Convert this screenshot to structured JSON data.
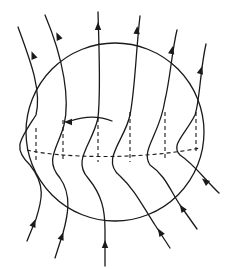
{
  "diagram": {
    "stroke_color": "#1a1a1a",
    "background": "#ffffff",
    "sphere": {
      "cx": 115,
      "cy": 132,
      "r": 89
    },
    "lines": [
      {
        "id": 1,
        "path": "M 27 241 L 36 219 C 42 200, 46 185, 30 165 C 12 148, 20 140, 36 115 C 42 90, 30 60, 18 27",
        "arrow_in": [
          34,
          223,
          -68
        ],
        "arrow_out": [
          33,
          55,
          -112
        ]
      },
      {
        "id": 2,
        "path": "M 55 258 L 63 233 C 68 215, 72 195, 60 178 C 44 160, 58 148, 64 125 C 70 100, 64 60, 45 15",
        "arrow_in": [
          62,
          236,
          -70
        ],
        "arrow_out": [
          58,
          36,
          -115
        ]
      },
      {
        "id": 3,
        "path": "M 105 266 L 105 230 C 105 210, 102 195, 88 178 C 72 160, 92 145, 98 118 C 101 90, 99 50, 98 12",
        "arrow_in": [
          105,
          244,
          -90
        ],
        "arrow_out": [
          98,
          26,
          -90
        ]
      },
      {
        "id": 4,
        "path": "M 170 248 L 155 225 C 142 205, 135 190, 120 176 C 100 160, 125 140, 130 115 C 135 90, 136 50, 140 16",
        "arrow_in": [
          160,
          232,
          -122
        ],
        "arrow_out": [
          137,
          30,
          -85
        ]
      },
      {
        "id": 5,
        "path": "M 197 229 L 180 205 C 170 190, 165 175, 150 165 C 140 150, 160 135, 165 100 C 170 80, 172 50, 177 30",
        "arrow_in": [
          182,
          208,
          -124
        ],
        "arrow_out": [
          172,
          50,
          -78
        ]
      },
      {
        "id": 6,
        "path": "M 219 193 C 205 180, 195 165, 180 155 C 170 145, 185 135, 195 115 C 200 100, 200 70, 206 44",
        "arrow_in": [
          205,
          181,
          -140
        ],
        "arrow_out": [
          201,
          70,
          -75
        ]
      }
    ],
    "equator_dashed": "M 27 150 C 60 158, 140 160, 200 148",
    "vertical_dashed": [
      {
        "x1": 36,
        "y1": 128,
        "x2": 36,
        "y2": 160
      },
      {
        "x1": 63,
        "y1": 120,
        "x2": 63,
        "y2": 160
      },
      {
        "x1": 98,
        "y1": 118,
        "x2": 98,
        "y2": 162
      },
      {
        "x1": 130,
        "y1": 112,
        "x2": 130,
        "y2": 162
      },
      {
        "x1": 165,
        "y1": 112,
        "x2": 165,
        "y2": 160
      },
      {
        "x1": 196,
        "y1": 112,
        "x2": 196,
        "y2": 152
      }
    ],
    "internal_arrow": {
      "path": "M 112 121 C 100 116, 85 116, 70 121",
      "head": [
        68,
        122,
        180
      ]
    }
  }
}
